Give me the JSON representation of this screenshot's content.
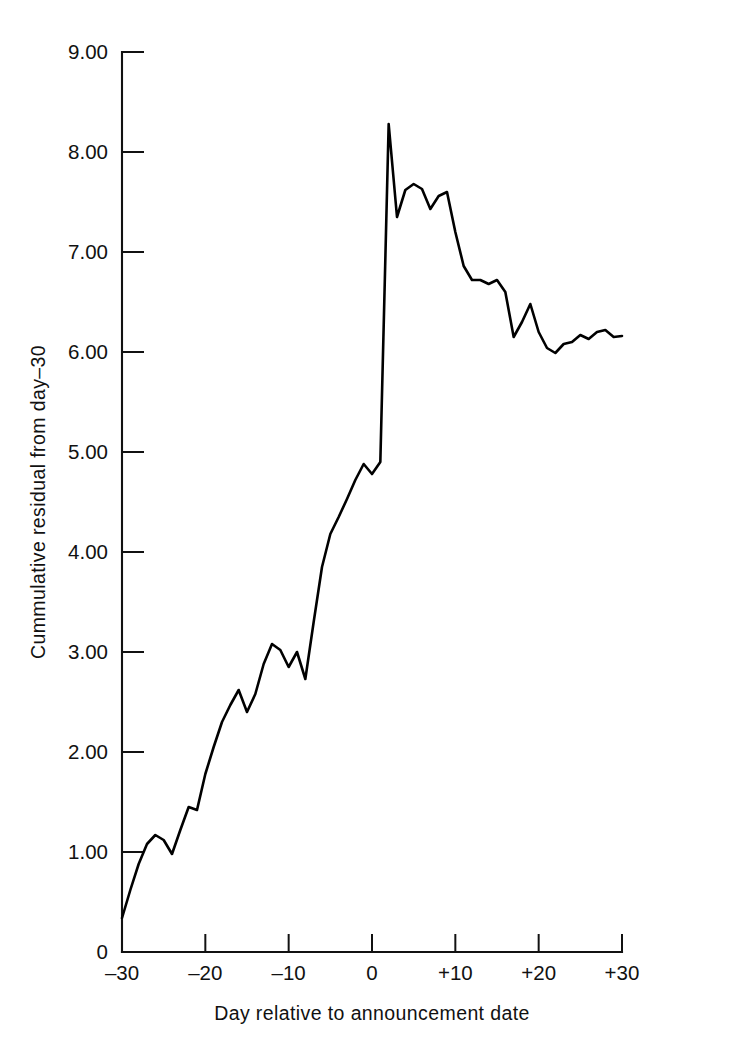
{
  "chart_data": {
    "type": "line",
    "title": "",
    "xlabel": "Day relative to announcement date",
    "ylabel": "Cummulative residual from day–30",
    "xlim": [
      -30,
      30
    ],
    "ylim": [
      0,
      9
    ],
    "grid": false,
    "legend": null,
    "xticks": [
      -30,
      -20,
      -10,
      0,
      10,
      20,
      30
    ],
    "xtick_labels": [
      "–30",
      "–20",
      "–10",
      "0",
      "+10",
      "+20",
      "+30"
    ],
    "yticks": [
      0,
      1,
      2,
      3,
      4,
      5,
      6,
      7,
      8,
      9
    ],
    "ytick_labels": [
      "0",
      "1.00",
      "2.00",
      "3.00",
      "4.00",
      "5.00",
      "6.00",
      "7.00",
      "8.00",
      "9.00"
    ],
    "line_color": "#000000",
    "x": [
      -30,
      -29,
      -28,
      -27,
      -26,
      -25,
      -24,
      -23,
      -22,
      -21,
      -20,
      -19,
      -18,
      -17,
      -16,
      -15,
      -14,
      -13,
      -12,
      -11,
      -10,
      -9,
      -8,
      -7,
      -6,
      -5,
      -4,
      -3,
      -2,
      -1,
      0,
      1,
      2,
      3,
      4,
      5,
      6,
      7,
      8,
      9,
      10,
      11,
      12,
      13,
      14,
      15,
      16,
      17,
      18,
      19,
      20,
      21,
      22,
      23,
      24,
      25,
      26,
      27,
      28,
      29,
      30
    ],
    "y": [
      0.34,
      0.62,
      0.88,
      1.08,
      1.17,
      1.12,
      0.98,
      1.22,
      1.45,
      1.42,
      1.78,
      2.05,
      2.3,
      2.47,
      2.62,
      2.4,
      2.58,
      2.88,
      3.08,
      3.02,
      2.85,
      3.0,
      2.73,
      3.3,
      3.85,
      4.18,
      4.35,
      4.53,
      4.72,
      4.88,
      4.78,
      4.9,
      8.28,
      7.35,
      7.62,
      7.68,
      7.63,
      7.43,
      7.56,
      7.6,
      7.2,
      6.86,
      6.72,
      6.72,
      6.68,
      6.72,
      6.6,
      6.15,
      6.3,
      6.48,
      6.2,
      6.04,
      5.99,
      6.08,
      6.1,
      6.17,
      6.13,
      6.2,
      6.22,
      6.15,
      6.16
    ]
  },
  "axes": {
    "y_axis_name": "y-axis",
    "x_axis_name": "x-axis"
  }
}
